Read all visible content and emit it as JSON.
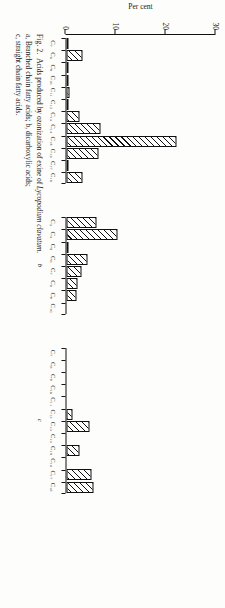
{
  "figure": {
    "label": "Fig. 2.",
    "caption_part1": "Acids produced by ozonization of exine of ",
    "caption_species": "Lycopodium clavatum",
    "caption_part2": ". ",
    "caption_a": "a, Branched chain fatty acids; ",
    "caption_b": "b, dicarboxylic acids; ",
    "caption_c": "c, straight chain fatty acids."
  },
  "axis": {
    "ytitle": "Per cent",
    "yticks": [
      "0",
      "10",
      "20",
      "30"
    ],
    "ylim_min": 0,
    "ylim_max": 30
  },
  "chart_data": [
    {
      "type": "bar",
      "panel": "a",
      "title": "Branched chain fatty acids",
      "ylabel": "Per cent",
      "xlabel": "",
      "ylim": [
        0,
        30
      ],
      "grid": false,
      "categories": [
        "C7",
        "C8",
        "C9",
        "C10",
        "C11",
        "C12",
        "C13",
        "C14",
        "C15",
        "C16",
        "C17",
        "C18"
      ],
      "category_labels": [
        "C₇",
        "C₈",
        "C₉",
        "C₁₀",
        "C₁₁",
        "C₁₂",
        "C₁₃",
        "C₁₄",
        "C₁₅",
        "C₁₆",
        "C₁₇",
        "C₁₈"
      ],
      "values": [
        0.3,
        3.2,
        0.4,
        0.5,
        0.6,
        0.5,
        2.6,
        6.8,
        22.0,
        6.5,
        0.4,
        3.3
      ]
    },
    {
      "type": "bar",
      "panel": "b",
      "title": "Dicarboxylic acids",
      "ylabel": "Per cent",
      "xlabel": "",
      "ylim": [
        0,
        30
      ],
      "grid": false,
      "categories": [
        "C3",
        "C4",
        "C5",
        "C6",
        "C7",
        "C8",
        "C9",
        "C10"
      ],
      "category_labels": [
        "C₃",
        "C₄",
        "C₅",
        "C₆",
        "C₇",
        "C₈",
        "C₉",
        "C₁₀"
      ],
      "values": [
        6.0,
        10.3,
        0.2,
        4.3,
        3.0,
        2.2,
        2.0,
        0.0
      ]
    },
    {
      "type": "bar",
      "panel": "c",
      "title": "Straight chain fatty acids",
      "ylabel": "Per cent",
      "xlabel": "",
      "ylim": [
        0,
        30
      ],
      "grid": false,
      "categories": [
        "C7",
        "C8",
        "C9",
        "C10",
        "C11",
        "C12",
        "C13",
        "C14",
        "C15",
        "C16",
        "C17",
        "C18"
      ],
      "category_labels": [
        "C₇",
        "C₈",
        "C₉",
        "C₁₀",
        "C₁₁",
        "C₁₂",
        "C₁₃",
        "C₁₄",
        "C₁₅",
        "C₁₆",
        "C₁₇",
        "C₁₈"
      ],
      "values": [
        0.0,
        0.0,
        0.0,
        0.0,
        0.0,
        1.3,
        4.7,
        0.0,
        2.6,
        0.0,
        5.1,
        5.4
      ]
    }
  ]
}
